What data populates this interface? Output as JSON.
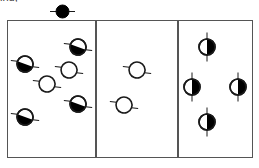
{
  "figure": {
    "caption_fragment": "ind;",
    "width": 259,
    "height": 168,
    "background_color": "#ffffff",
    "border_color": "#555555",
    "fill_color": "#000000",
    "outline_color": "#1a1a1a"
  },
  "top_marker": {
    "name": "filled-black-circle-marker",
    "symbol_type": "filled-circle",
    "x": 62,
    "y": 11,
    "radius": 6.5,
    "fill": "#000000",
    "ticks": "horizontal"
  },
  "panels": [
    {
      "id": "panel-left",
      "label": "left",
      "x": 7,
      "y": 20,
      "width": 89,
      "height": 138,
      "marker_count": 6,
      "markers": [
        {
          "symbol_type": "diagonal-half-filled-circle",
          "x": 25,
          "y": 64,
          "radius": 8,
          "angle": 20,
          "fill": "#000000"
        },
        {
          "symbol_type": "diagonal-half-filled-circle",
          "x": 78,
          "y": 47,
          "radius": 8,
          "angle": 20,
          "fill": "#000000"
        },
        {
          "symbol_type": "open-circle",
          "x": 69,
          "y": 70,
          "radius": 8,
          "angle": 20,
          "fill": "none"
        },
        {
          "symbol_type": "open-circle",
          "x": 47,
          "y": 84,
          "radius": 8,
          "angle": 20,
          "fill": "none"
        },
        {
          "symbol_type": "diagonal-half-filled-circle",
          "x": 78,
          "y": 104,
          "radius": 8,
          "angle": 20,
          "fill": "#000000"
        },
        {
          "symbol_type": "diagonal-half-filled-circle",
          "x": 25,
          "y": 117,
          "radius": 8,
          "angle": 20,
          "fill": "#000000"
        }
      ]
    },
    {
      "id": "panel-middle",
      "label": "middle",
      "x": 96,
      "y": 20,
      "width": 82,
      "height": 138,
      "marker_count": 2,
      "markers": [
        {
          "symbol_type": "open-circle",
          "x": 137,
          "y": 70,
          "radius": 8,
          "angle": 20,
          "fill": "none"
        },
        {
          "symbol_type": "open-circle",
          "x": 124,
          "y": 105,
          "radius": 8,
          "angle": 20,
          "fill": "none"
        }
      ]
    },
    {
      "id": "panel-right",
      "label": "right",
      "x": 178,
      "y": 20,
      "width": 75,
      "height": 138,
      "marker_count": 4,
      "markers": [
        {
          "symbol_type": "vertical-half-filled-circle",
          "x": 207,
          "y": 47,
          "radius": 8,
          "angle": 0,
          "fill": "#000000"
        },
        {
          "symbol_type": "vertical-half-filled-circle",
          "x": 192,
          "y": 87,
          "radius": 8,
          "angle": 0,
          "fill": "#000000"
        },
        {
          "symbol_type": "vertical-half-filled-circle",
          "x": 238,
          "y": 87,
          "radius": 8,
          "angle": 0,
          "fill": "#000000"
        },
        {
          "symbol_type": "vertical-half-filled-circle",
          "x": 207,
          "y": 122,
          "radius": 8,
          "angle": 0,
          "fill": "#000000"
        }
      ]
    }
  ]
}
